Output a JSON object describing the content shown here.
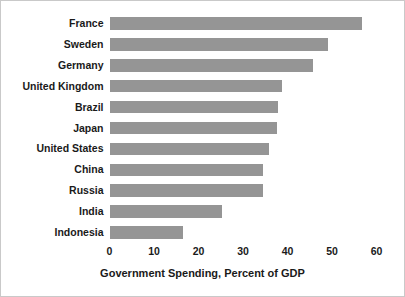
{
  "chart_data": {
    "type": "bar",
    "orientation": "horizontal",
    "title": "",
    "xlabel": "Government Spending, Percent of GDP",
    "ylabel": "",
    "xlim": [
      0,
      60
    ],
    "xticks": [
      0,
      10,
      20,
      30,
      40,
      50,
      60
    ],
    "xtick_labels": [
      "0",
      "10",
      "20",
      "30",
      "40",
      "50",
      "60"
    ],
    "grid": false,
    "legend": null,
    "bar_color": "#959595",
    "categories": [
      "France",
      "Sweden",
      "Germany",
      "United Kingdom",
      "Brazil",
      "Japan",
      "United States",
      "China",
      "Russia",
      "India",
      "Indonesia"
    ],
    "values": [
      56.8,
      49.0,
      45.8,
      38.8,
      37.8,
      37.7,
      35.8,
      34.6,
      34.4,
      25.3,
      16.6
    ]
  }
}
